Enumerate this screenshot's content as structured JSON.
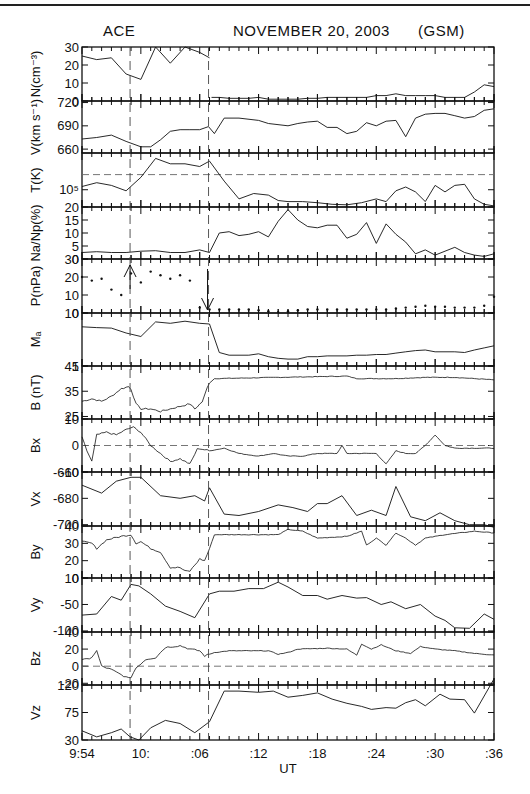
{
  "header": {
    "spacecraft": "ACE",
    "date": "NOVEMBER 20, 2003",
    "frame": "(GSM)"
  },
  "chart_data": {
    "type": "line",
    "xlabel": "UT",
    "x_ticks": [
      "9:54",
      "10:",
      ":06",
      ":12",
      ":18",
      ":24",
      ":30",
      ":36"
    ],
    "x_range_minutes": [
      0,
      42
    ],
    "x_unit": "minutes after 9:54 UT",
    "vertical_markers_minutes": [
      4.9,
      12.9
    ],
    "panels": [
      {
        "id": "N",
        "ylabel": "N(cm⁻³)",
        "yticks": [
          "0",
          "10",
          "20",
          "30"
        ],
        "ylim": [
          0,
          30
        ],
        "scale": "linear",
        "style": "line",
        "x": [
          0,
          1.5,
          3,
          4.5,
          6,
          7.5,
          9,
          10.5,
          12,
          13
        ],
        "values": [
          25,
          23,
          24,
          15,
          12,
          30,
          21,
          30,
          27,
          24
        ],
        "x2": [
          13.2,
          14,
          15,
          16,
          17,
          18,
          19,
          20,
          21,
          22,
          23,
          24,
          25,
          26,
          27,
          28,
          29,
          30,
          31,
          32,
          33,
          34,
          35,
          36,
          37,
          38,
          39,
          40,
          41,
          42
        ],
        "values2": [
          2,
          2,
          1.5,
          1.5,
          1.5,
          2,
          1,
          1,
          1,
          1,
          1.5,
          1.5,
          2,
          2,
          2,
          2,
          2,
          3,
          3,
          4,
          3,
          3,
          3,
          3,
          2,
          2,
          2,
          5,
          9,
          8
        ]
      },
      {
        "id": "V",
        "ylabel": "V(km s⁻¹)",
        "yticks": [
          "660",
          "690",
          "720"
        ],
        "ylim": [
          655,
          722
        ],
        "scale": "linear",
        "style": "line",
        "x": [
          0,
          1.5,
          3,
          4.5,
          6,
          7,
          8,
          9,
          10,
          11,
          12,
          12.9,
          13.5,
          14.5,
          16,
          18,
          19,
          21,
          22,
          23,
          24,
          25,
          26,
          27,
          28,
          29,
          30,
          31,
          32,
          33,
          34,
          35,
          36,
          37,
          38,
          39,
          40,
          41,
          42
        ],
        "values": [
          673,
          675,
          678,
          670,
          663,
          663,
          672,
          683,
          685,
          685,
          685,
          689,
          680,
          700,
          700,
          697,
          693,
          690,
          693,
          695,
          696,
          688,
          688,
          680,
          683,
          694,
          690,
          696,
          697,
          676,
          700,
          705,
          706,
          706,
          703,
          700,
          702,
          710,
          712
        ]
      },
      {
        "id": "T",
        "ylabel": "T(K)",
        "yticks": [
          "10⁵"
        ],
        "scale": "log",
        "style": "line",
        "dashed_reference": true,
        "x": [
          0,
          1.5,
          3,
          4.5,
          6,
          7.5,
          9,
          10.5,
          12,
          13,
          14.5,
          16,
          17.5,
          19,
          20,
          21,
          22.5,
          24,
          25.5,
          27,
          28.5,
          30,
          31,
          32,
          33,
          34,
          35,
          36,
          37,
          38,
          39,
          40,
          41,
          42
        ],
        "values_norm": [
          0.62,
          0.55,
          0.6,
          0.7,
          0.45,
          0.1,
          0.2,
          0.2,
          0.25,
          0.15,
          0.52,
          0.85,
          0.75,
          0.78,
          0.88,
          0.9,
          0.9,
          0.92,
          0.95,
          0.96,
          0.92,
          0.85,
          0.9,
          0.7,
          0.63,
          0.72,
          0.9,
          0.6,
          0.72,
          0.6,
          0.58,
          0.85,
          0.95,
          0.98
        ]
      },
      {
        "id": "NaNp",
        "ylabel": "Na/Np(%)",
        "yticks": [
          "0",
          "5",
          "10",
          "15",
          "20"
        ],
        "ylim": [
          0,
          20
        ],
        "scale": "linear",
        "style": "line",
        "x": [
          0,
          1.5,
          3,
          4.5,
          6,
          7.5,
          9,
          10.5,
          12,
          13,
          14,
          15,
          16,
          17,
          18,
          19,
          20,
          21,
          22,
          23,
          24,
          25,
          26,
          27,
          28,
          29,
          30,
          31,
          32,
          33,
          34,
          35,
          36,
          37,
          38,
          39,
          40,
          41,
          42
        ],
        "values": [
          2.5,
          2.8,
          2.5,
          2.5,
          3,
          3.2,
          2.5,
          2.5,
          3.5,
          2.5,
          10,
          10.5,
          9,
          9.5,
          10.5,
          8.5,
          14.5,
          19,
          15,
          12.5,
          12,
          13,
          13,
          8,
          9.5,
          14,
          6,
          13.5,
          9.5,
          6.5,
          2,
          3.5,
          1.5,
          3,
          4.5,
          2.5,
          1.5,
          1,
          2
        ]
      },
      {
        "id": "P",
        "ylabel": "P(nPa)",
        "yticks": [
          "0",
          "10",
          "20",
          "30"
        ],
        "ylim": [
          0,
          30
        ],
        "scale": "linear",
        "style": "dots",
        "x": [
          0,
          1,
          2,
          3,
          4,
          5,
          6,
          7,
          8,
          9,
          10,
          11,
          12,
          13,
          14,
          15,
          16,
          17,
          18,
          19,
          20,
          21,
          22,
          23,
          24,
          25,
          26,
          27,
          28,
          29,
          30,
          31,
          32,
          33,
          34,
          35,
          36,
          37,
          38,
          39,
          40,
          41,
          42
        ],
        "values": [
          20,
          18,
          19,
          13,
          10,
          22,
          17,
          23,
          21,
          19,
          21,
          18,
          3,
          2,
          2,
          2,
          2,
          2,
          1.5,
          1,
          0.5,
          1,
          1.5,
          2,
          2,
          2,
          2,
          2,
          2,
          2,
          2,
          2,
          2.5,
          3,
          3.5,
          4,
          3.5,
          3.5,
          3,
          3,
          3,
          4,
          9
        ]
      },
      {
        "id": "MA",
        "ylabel": "Mₐ",
        "yticks": [
          "1",
          "10"
        ],
        "ylim": [
          1,
          10
        ],
        "scale": "log",
        "style": "line",
        "x": [
          0,
          1.5,
          3,
          4.5,
          6,
          7.5,
          9,
          10.5,
          12,
          13,
          14,
          15,
          16,
          17,
          18,
          19,
          20,
          21,
          22,
          23,
          24,
          25,
          26,
          27,
          28,
          29,
          30,
          31,
          32,
          33,
          34,
          35,
          36,
          37,
          38,
          39,
          40,
          41,
          42
        ],
        "values": [
          5.5,
          5.3,
          5.2,
          4.2,
          3.6,
          6.8,
          6.4,
          7,
          6.4,
          6.2,
          1.8,
          1.6,
          1.6,
          1.6,
          1.7,
          1.5,
          1.4,
          1.35,
          1.35,
          1.5,
          1.5,
          1.55,
          1.55,
          1.55,
          1.6,
          1.6,
          1.65,
          1.65,
          1.75,
          1.85,
          1.95,
          2,
          1.85,
          1.85,
          1.85,
          1.8,
          2,
          2.2,
          2.4
        ]
      },
      {
        "id": "B",
        "ylabel": "B (nT)",
        "yticks": [
          "25",
          "35",
          "45"
        ],
        "ylim": [
          24,
          45
        ],
        "scale": "linear",
        "style": "line_dense",
        "description": "B rises from ~26-37 nT before 10:07 to ~40-41 nT after; peaks ~37 near 9:59"
      },
      {
        "id": "Bx",
        "ylabel": "Bx",
        "yticks": [
          "-10",
          "0",
          "10"
        ],
        "ylim": [
          -10,
          10
        ],
        "scale": "linear",
        "style": "line_dense",
        "zero_dashed": true,
        "description": "Bx ~5-7 nT near 9:58-9:59, dips to ~-7 near 10:03, mostly -2 to -4 after 10:07, peak ~4 near 10:31"
      },
      {
        "id": "Vx",
        "ylabel": "Vx",
        "yticks": [
          "-700",
          "-680",
          "-660"
        ],
        "ylim": [
          -701,
          -660
        ],
        "scale": "linear",
        "style": "line",
        "x": [
          0,
          2,
          3.5,
          5,
          6,
          8,
          10,
          11.5,
          12.5,
          13,
          14.5,
          16,
          18,
          20,
          21.5,
          23,
          24,
          25,
          26.5,
          28,
          29.5,
          31,
          32,
          33.5,
          35,
          36.5,
          38,
          39.5,
          41,
          42
        ],
        "values": [
          -670,
          -676,
          -667,
          -664,
          -664,
          -678,
          -680,
          -678,
          -682,
          -672,
          -692,
          -693,
          -690,
          -685,
          -687,
          -690,
          -684,
          -684,
          -678,
          -693,
          -689,
          -693,
          -671,
          -694,
          -697,
          -691,
          -697,
          -700,
          -700,
          -702
        ]
      },
      {
        "id": "By",
        "ylabel": "By",
        "yticks": [
          "10",
          "20",
          "30",
          "40"
        ],
        "ylim": [
          10,
          40
        ],
        "scale": "linear",
        "style": "line_dense",
        "description": "By ~30-35 before 9:59, drops to ~15 near 10:02-10:03, recovers to ~35 by 10:07, ~33-38 after with dip ~28 near 10:23"
      },
      {
        "id": "Vy",
        "ylabel": "Vy",
        "yticks": [
          "-100",
          "-50",
          "0"
        ],
        "ylim": [
          -102,
          0
        ],
        "scale": "linear",
        "style": "line",
        "x": [
          0,
          1.5,
          3,
          4,
          5,
          5.8,
          7,
          8.5,
          10,
          11.5,
          13,
          14,
          15.5,
          17,
          18.5,
          20,
          21,
          22.5,
          24,
          25,
          26.5,
          28,
          29,
          30.5,
          31.5,
          33,
          34.5,
          36,
          37,
          38,
          39.5,
          41,
          42
        ],
        "values": [
          -70,
          -68,
          -35,
          -42,
          -12,
          -15,
          -30,
          -53,
          -63,
          -75,
          -30,
          -25,
          -25,
          -20,
          -20,
          -8,
          -17,
          -33,
          -33,
          -40,
          -33,
          -38,
          -37,
          -50,
          -45,
          -58,
          -50,
          -72,
          -80,
          -94,
          -95,
          -68,
          -78
        ]
      },
      {
        "id": "Bz",
        "ylabel": "Bz",
        "yticks": [
          "-20",
          "0",
          "20",
          "40"
        ],
        "ylim": [
          -22,
          40
        ],
        "scale": "linear",
        "style": "line_dense",
        "zero_dashed": true,
        "description": "Bz ~5-15 early, dips to ~-15 near 9:59, rises to ~22 by 10:02, ~15-20 thereafter with spikes ~25 near 10:22"
      },
      {
        "id": "Vz",
        "ylabel": "Vz",
        "yticks": [
          "30",
          "75",
          "120"
        ],
        "ylim": [
          30,
          120
        ],
        "scale": "linear",
        "style": "line",
        "x": [
          0,
          1.5,
          3,
          4,
          4.9,
          5.8,
          7,
          8.5,
          10,
          11.5,
          13,
          14.5,
          16,
          18,
          19.5,
          21,
          22.5,
          24,
          25.5,
          27,
          28.5,
          29.5,
          31,
          32,
          33,
          34,
          35,
          36.5,
          37.5,
          39,
          40,
          42
        ],
        "values": [
          45,
          35,
          42,
          48,
          35,
          30,
          50,
          62,
          57,
          42,
          60,
          110,
          110,
          108,
          110,
          100,
          103,
          107,
          97,
          90,
          85,
          80,
          83,
          82,
          91,
          96,
          86,
          105,
          97,
          96,
          74,
          130
        ]
      }
    ]
  },
  "footer": {
    "caption": ""
  }
}
